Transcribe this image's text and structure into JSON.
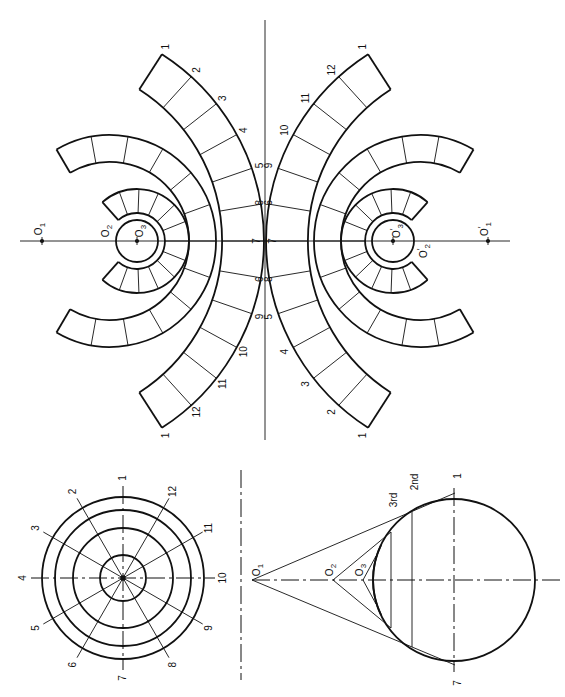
{
  "figure": {
    "views": {
      "plan": {
        "name": "Plan view",
        "center": [
          123,
          578
        ],
        "ring_radii": [
          81,
          68,
          50,
          23
        ],
        "division_labels": [
          "1",
          "2",
          "3",
          "4",
          "5",
          "6",
          "7",
          "8",
          "9",
          "10",
          "11",
          "12"
        ]
      },
      "elevation": {
        "name": "Elevation view",
        "sphere_center": [
          454,
          580
        ],
        "sphere_radius": 81,
        "apex_labels": {
          "o1": "O",
          "o1_sub": "1",
          "o2": "O",
          "o2_sub": "2",
          "o3": "O",
          "o3_sub": "3"
        },
        "zone_labels": {
          "second": "2nd",
          "third": "3rd"
        },
        "end_labels": {
          "top": "1",
          "bottom": "7"
        }
      },
      "development": {
        "name": "Development of zones",
        "axis_y": 241,
        "mirror_x": 265,
        "left_centers": {
          "o1": {
            "label": "O",
            "sub": "1",
            "pos": [
              42,
              241
            ]
          },
          "o2": {
            "label": "O",
            "sub": "2",
            "pos": [
              110,
              241
            ]
          },
          "o3": {
            "label": "O",
            "sub": "3",
            "pos": [
              137,
              241
            ]
          }
        },
        "right_centers": {
          "o1": {
            "label": "O",
            "sub": "1",
            "prime": "′",
            "pos": [
              488,
              241
            ]
          },
          "o2": {
            "label": "O",
            "sub": "2",
            "prime": "′",
            "pos": [
              420,
              241
            ]
          },
          "o3": {
            "label": "O",
            "sub": "3",
            "prime": "′",
            "pos": [
              393,
              241
            ]
          }
        },
        "outer_band_labels": [
          "1",
          "2",
          "3",
          "4",
          "5",
          "6",
          "7",
          "8",
          "9",
          "10",
          "11",
          "12",
          "1"
        ]
      }
    }
  }
}
